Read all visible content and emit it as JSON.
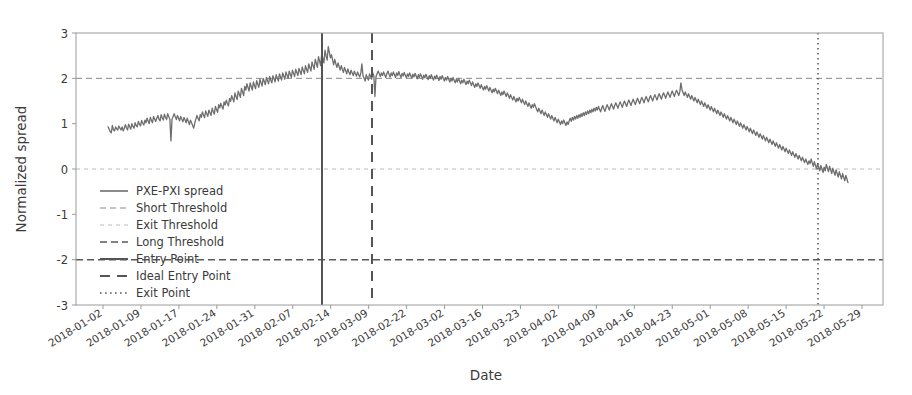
{
  "chart_data": {
    "type": "line",
    "title": "",
    "xlabel": "Date",
    "ylabel": "Normalized spread",
    "ylim": [
      -3,
      3
    ],
    "yticks": [
      -3,
      -2,
      -1,
      0,
      1,
      2,
      3
    ],
    "ytick_labels": [
      "-3",
      "-2",
      "-1",
      "0",
      "1",
      "2",
      "3"
    ],
    "grid": false,
    "legend_position": "lower left",
    "xtick_labels": [
      "2018-01-02",
      "2018-01-09",
      "2018-01-17",
      "2018-01-24",
      "2018-01-31",
      "2018-02-07",
      "2018-02-14",
      "2018-03-09",
      "2018-02-22",
      "2018-03-02",
      "2018-03-16",
      "2018-03-23",
      "2018-04-02",
      "2018-04-09",
      "2018-04-16",
      "2018-04-23",
      "2018-05-01",
      "2018-05-08",
      "2018-05-15",
      "2018-05-22",
      "2018-05-29"
    ],
    "legend": [
      {
        "label": "PXE-PXI spread",
        "style": "solid",
        "color": "#6e6e6e",
        "width": 1.6
      },
      {
        "label": "Short Threshold",
        "style": "dashed",
        "color": "#8a8a8a",
        "width": 1.0
      },
      {
        "label": "Exit Threshold",
        "style": "dotted-fine",
        "color": "#b8b8b8",
        "width": 1.0
      },
      {
        "label": "Long Threshold",
        "style": "dashed-bold",
        "color": "#5a5a5a",
        "width": 1.4
      },
      {
        "label": "Entry Point",
        "style": "solid-bold",
        "color": "#555555",
        "width": 2.0
      },
      {
        "label": "Ideal Entry Point",
        "style": "dashed-big",
        "color": "#555555",
        "width": 2.0
      },
      {
        "label": "Exit Point",
        "style": "dotted",
        "color": "#555555",
        "width": 1.6
      }
    ],
    "hlines": [
      {
        "name": "Short Threshold",
        "value": 2,
        "color": "#8a8a8a",
        "style": "dashed"
      },
      {
        "name": "Exit Threshold",
        "value": 0,
        "color": "#b8b8b8",
        "style": "dotted-fine"
      },
      {
        "name": "Long Threshold",
        "value": -2,
        "color": "#5a5a5a",
        "style": "dashed-bold"
      }
    ],
    "vlines": [
      {
        "name": "Entry Point",
        "date": "2018-02-14",
        "style": "solid-bold"
      },
      {
        "name": "Ideal Entry Point",
        "date": "2018-03-09",
        "style": "dashed-big"
      },
      {
        "name": "Exit Point",
        "date": "2018-05-22",
        "style": "dotted"
      }
    ],
    "series": [
      {
        "name": "PXE-PXI spread",
        "color": "#6e6e6e",
        "values": [
          0.93,
          0.88,
          0.82,
          0.8,
          0.96,
          0.86,
          0.84,
          0.93,
          0.88,
          0.86,
          0.95,
          0.9,
          0.86,
          0.93,
          0.84,
          0.9,
          0.98,
          0.91,
          0.86,
          0.99,
          0.93,
          0.88,
          1.0,
          0.94,
          0.9,
          1.02,
          0.96,
          0.93,
          1.05,
          0.99,
          0.95,
          1.07,
          1.01,
          0.97,
          1.08,
          1.02,
          1.12,
          1.06,
          1.0,
          1.14,
          1.07,
          1.02,
          1.16,
          1.1,
          1.05,
          1.12,
          1.18,
          1.1,
          1.06,
          1.2,
          1.13,
          1.08,
          1.21,
          1.14,
          1.09,
          1.22,
          1.16,
          1.1,
          0.62,
          1.1,
          1.16,
          1.22,
          1.15,
          1.09,
          1.18,
          1.12,
          1.06,
          1.16,
          1.1,
          1.04,
          1.14,
          1.08,
          1.02,
          1.12,
          1.05,
          0.98,
          1.08,
          1.02,
          0.96,
          0.9,
          1.02,
          1.1,
          1.18,
          1.12,
          1.06,
          1.2,
          1.14,
          1.26,
          1.19,
          1.13,
          1.28,
          1.22,
          1.16,
          1.3,
          1.24,
          1.18,
          1.34,
          1.27,
          1.21,
          1.38,
          1.31,
          1.25,
          1.42,
          1.35,
          1.45,
          1.38,
          1.32,
          1.48,
          1.41,
          1.52,
          1.45,
          1.39,
          1.56,
          1.49,
          1.62,
          1.55,
          1.48,
          1.68,
          1.6,
          1.53,
          1.72,
          1.65,
          1.58,
          1.78,
          1.7,
          1.62,
          1.82,
          1.74,
          1.88,
          1.8,
          1.72,
          1.9,
          1.82,
          1.74,
          1.92,
          1.84,
          1.77,
          1.95,
          1.87,
          1.8,
          1.98,
          1.9,
          1.83,
          2.0,
          1.93,
          1.86,
          2.02,
          1.95,
          1.88,
          2.04,
          1.96,
          1.9,
          2.06,
          1.99,
          1.92,
          2.08,
          2.01,
          1.94,
          2.1,
          2.03,
          1.96,
          2.12,
          2.05,
          1.98,
          2.14,
          2.07,
          2.0,
          2.16,
          2.09,
          2.02,
          2.18,
          2.11,
          2.04,
          2.2,
          2.13,
          2.06,
          2.22,
          2.15,
          2.08,
          2.25,
          2.17,
          2.1,
          2.28,
          2.2,
          2.13,
          2.32,
          2.24,
          2.16,
          2.36,
          2.28,
          2.2,
          2.42,
          2.33,
          2.24,
          2.48,
          2.38,
          2.28,
          2.55,
          2.44,
          2.34,
          2.62,
          2.5,
          2.4,
          2.7,
          2.58,
          2.45,
          2.52,
          2.4,
          2.3,
          2.42,
          2.32,
          2.24,
          2.34,
          2.26,
          2.18,
          2.28,
          2.2,
          2.13,
          2.24,
          2.17,
          2.1,
          2.21,
          2.14,
          2.08,
          2.18,
          2.12,
          2.06,
          2.16,
          2.1,
          2.05,
          2.14,
          2.08,
          2.03,
          2.12,
          2.32,
          2.06,
          2.0,
          1.94,
          2.08,
          2.02,
          1.96,
          2.1,
          2.04,
          1.98,
          2.12,
          2.06,
          1.6,
          2.04,
          2.1,
          2.16,
          2.1,
          2.04,
          2.12,
          2.06,
          2.14,
          2.08,
          2.02,
          2.1,
          2.16,
          2.09,
          2.03,
          2.12,
          2.06,
          2.14,
          2.08,
          2.02,
          2.12,
          2.06,
          2.15,
          2.08,
          2.02,
          2.11,
          2.05,
          2.13,
          2.07,
          2.01,
          2.1,
          2.04,
          2.12,
          2.06,
          2.0,
          2.09,
          2.03,
          2.11,
          2.05,
          1.99,
          2.08,
          2.02,
          2.1,
          2.04,
          1.98,
          2.07,
          2.01,
          2.09,
          2.03,
          1.97,
          2.06,
          2.0,
          2.08,
          2.02,
          1.96,
          2.05,
          1.99,
          2.07,
          2.01,
          1.95,
          2.04,
          1.98,
          2.06,
          2.0,
          1.94,
          2.02,
          1.96,
          2.04,
          1.98,
          1.92,
          2.0,
          1.94,
          2.02,
          1.96,
          1.9,
          1.98,
          1.92,
          2.0,
          1.94,
          1.88,
          1.96,
          1.9,
          1.98,
          1.92,
          1.86,
          1.94,
          1.88,
          1.96,
          1.9,
          1.84,
          1.92,
          1.86,
          1.8,
          1.88,
          1.82,
          1.9,
          1.84,
          1.78,
          1.86,
          1.8,
          1.74,
          1.82,
          1.76,
          1.84,
          1.78,
          1.72,
          1.8,
          1.74,
          1.68,
          1.76,
          1.7,
          1.78,
          1.72,
          1.66,
          1.74,
          1.68,
          1.62,
          1.7,
          1.64,
          1.72,
          1.66,
          1.6,
          1.68,
          1.62,
          1.56,
          1.64,
          1.58,
          1.52,
          1.6,
          1.54,
          1.48,
          1.56,
          1.5,
          1.58,
          1.52,
          1.46,
          1.54,
          1.48,
          1.42,
          1.5,
          1.44,
          1.38,
          1.46,
          1.4,
          1.34,
          1.42,
          1.36,
          1.44,
          1.38,
          1.32,
          1.26,
          1.34,
          1.28,
          1.22,
          1.3,
          1.24,
          1.18,
          1.26,
          1.2,
          1.14,
          1.22,
          1.16,
          1.1,
          1.18,
          1.12,
          1.06,
          1.14,
          1.08,
          1.02,
          1.1,
          1.04,
          0.98,
          1.06,
          1.0,
          1.08,
          1.02,
          0.96,
          1.04,
          0.98,
          1.06,
          1.12,
          1.05,
          1.14,
          1.08,
          1.16,
          1.1,
          1.18,
          1.12,
          1.2,
          1.14,
          1.22,
          1.16,
          1.24,
          1.18,
          1.26,
          1.2,
          1.28,
          1.22,
          1.3,
          1.24,
          1.32,
          1.26,
          1.34,
          1.28,
          1.36,
          1.3,
          1.38,
          1.32,
          1.26,
          1.34,
          1.4,
          1.33,
          1.27,
          1.35,
          1.42,
          1.36,
          1.3,
          1.38,
          1.44,
          1.38,
          1.32,
          1.4,
          1.46,
          1.4,
          1.34,
          1.42,
          1.48,
          1.42,
          1.36,
          1.44,
          1.5,
          1.44,
          1.38,
          1.46,
          1.52,
          1.46,
          1.4,
          1.48,
          1.54,
          1.48,
          1.42,
          1.5,
          1.56,
          1.5,
          1.44,
          1.52,
          1.58,
          1.52,
          1.46,
          1.54,
          1.6,
          1.54,
          1.48,
          1.56,
          1.62,
          1.56,
          1.5,
          1.58,
          1.64,
          1.58,
          1.52,
          1.6,
          1.66,
          1.6,
          1.54,
          1.62,
          1.68,
          1.62,
          1.56,
          1.64,
          1.7,
          1.64,
          1.58,
          1.66,
          1.72,
          1.66,
          1.6,
          1.68,
          1.74,
          1.68,
          1.62,
          1.7,
          1.9,
          1.75,
          1.68,
          1.62,
          1.7,
          1.64,
          1.58,
          1.66,
          1.6,
          1.54,
          1.62,
          1.56,
          1.5,
          1.58,
          1.52,
          1.46,
          1.54,
          1.48,
          1.42,
          1.5,
          1.44,
          1.38,
          1.46,
          1.4,
          1.34,
          1.42,
          1.36,
          1.3,
          1.38,
          1.32,
          1.26,
          1.34,
          1.28,
          1.22,
          1.3,
          1.24,
          1.18,
          1.26,
          1.2,
          1.14,
          1.22,
          1.16,
          1.1,
          1.18,
          1.12,
          1.06,
          1.14,
          1.08,
          1.02,
          1.1,
          1.04,
          0.98,
          1.06,
          1.0,
          0.94,
          1.02,
          0.96,
          0.9,
          0.98,
          0.92,
          0.86,
          0.94,
          0.88,
          0.82,
          0.9,
          0.84,
          0.78,
          0.86,
          0.8,
          0.74,
          0.82,
          0.76,
          0.7,
          0.78,
          0.72,
          0.66,
          0.74,
          0.68,
          0.62,
          0.7,
          0.64,
          0.58,
          0.66,
          0.6,
          0.54,
          0.62,
          0.56,
          0.5,
          0.58,
          0.52,
          0.46,
          0.54,
          0.48,
          0.42,
          0.5,
          0.44,
          0.38,
          0.46,
          0.4,
          0.34,
          0.42,
          0.36,
          0.3,
          0.38,
          0.32,
          0.26,
          0.34,
          0.28,
          0.22,
          0.3,
          0.24,
          0.18,
          0.26,
          0.2,
          0.14,
          0.22,
          0.16,
          0.1,
          0.18,
          0.12,
          0.22,
          0.14,
          0.06,
          0.16,
          0.08,
          0.0,
          0.12,
          0.04,
          -0.04,
          0.08,
          0.0,
          -0.08,
          0.04,
          -0.04,
          0.1,
          0.02,
          -0.06,
          0.06,
          -0.02,
          -0.1,
          0.02,
          -0.06,
          -0.14,
          -0.02,
          -0.1,
          -0.18,
          -0.06,
          -0.14,
          -0.22,
          -0.1,
          -0.18,
          -0.26,
          -0.14,
          -0.22,
          -0.3
        ]
      }
    ]
  }
}
